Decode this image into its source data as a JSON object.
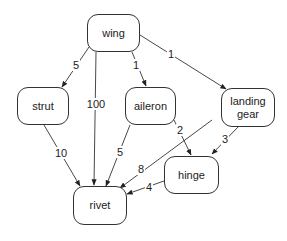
{
  "diagram": {
    "type": "directed-graph",
    "nodes": [
      {
        "id": "wing",
        "label": "wing",
        "x": 87,
        "y": 14,
        "w": 53,
        "h": 38
      },
      {
        "id": "strut",
        "label": "strut",
        "x": 17,
        "y": 87,
        "w": 52,
        "h": 38
      },
      {
        "id": "aileron",
        "label": "aileron",
        "x": 125,
        "y": 87,
        "w": 51,
        "h": 38
      },
      {
        "id": "landing_gear",
        "label": "landing gear",
        "x": 221,
        "y": 88,
        "w": 54,
        "h": 39
      },
      {
        "id": "hinge",
        "label": "hinge",
        "x": 164,
        "y": 156,
        "w": 55,
        "h": 38
      },
      {
        "id": "rivet",
        "label": "rivet",
        "x": 73,
        "y": 186,
        "w": 54,
        "h": 39
      }
    ],
    "edges": [
      {
        "from": "wing",
        "to": "strut",
        "label": "5",
        "x1": 89,
        "y1": 47,
        "x2": 62,
        "y2": 87,
        "lx": 76,
        "ly": 65
      },
      {
        "from": "wing",
        "to": "rivet",
        "label": "100",
        "x1": 96,
        "y1": 52,
        "x2": 94,
        "y2": 185,
        "lx": 96,
        "ly": 104
      },
      {
        "from": "wing",
        "to": "aileron",
        "label": "1",
        "x1": 132,
        "y1": 52,
        "x2": 146,
        "y2": 86,
        "lx": 136,
        "ly": 65
      },
      {
        "from": "wing",
        "to": "landing_gear",
        "label": "1",
        "x1": 140,
        "y1": 35,
        "x2": 226,
        "y2": 89,
        "lx": 171,
        "ly": 54
      },
      {
        "from": "strut",
        "to": "rivet",
        "label": "10",
        "x1": 44,
        "y1": 125,
        "x2": 80,
        "y2": 186,
        "lx": 61,
        "ly": 153
      },
      {
        "from": "aileron",
        "to": "rivet",
        "label": "5",
        "x1": 130,
        "y1": 125,
        "x2": 106,
        "y2": 186,
        "lx": 120,
        "ly": 152
      },
      {
        "from": "aileron",
        "to": "hinge",
        "label": "2",
        "x1": 174,
        "y1": 120,
        "x2": 191,
        "y2": 155,
        "lx": 180,
        "ly": 130
      },
      {
        "from": "landing_gear",
        "to": "rivet",
        "label": "8",
        "x1": 212,
        "y1": 120,
        "x2": 120,
        "y2": 188,
        "lx": 141,
        "ly": 169
      },
      {
        "from": "landing_gear",
        "to": "hinge",
        "label": "3",
        "x1": 238,
        "y1": 127,
        "x2": 212,
        "y2": 154,
        "lx": 225,
        "ly": 139
      },
      {
        "from": "hinge",
        "to": "rivet",
        "label": "4",
        "x1": 164,
        "y1": 181,
        "x2": 127,
        "y2": 194,
        "lx": 149,
        "ly": 187
      }
    ]
  }
}
